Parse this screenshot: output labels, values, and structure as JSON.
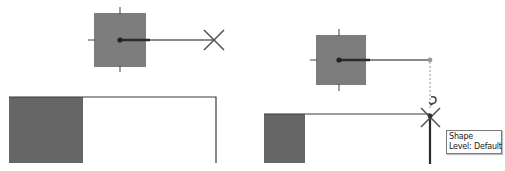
{
  "colors": {
    "background": "#ffffff",
    "shape_fill": "#7d7d7d",
    "shape_fill_dark": "#666666",
    "outline": "#3a3a3a",
    "handle_line": "#8a8a8a",
    "handle_line_thick": "#2a2a2a",
    "snap_marker": "#555555",
    "tooltip_border": "#7a7a7a"
  },
  "left_panel": {
    "shape": {
      "x": 94,
      "y": 13,
      "w": 52,
      "h": 54,
      "center": [
        120,
        40
      ]
    },
    "handle": {
      "from": [
        120,
        40
      ],
      "to": [
        214,
        40
      ],
      "thick_to": 150
    },
    "x_marker": {
      "cx": 214,
      "cy": 40,
      "size": 10
    },
    "wall": {
      "x1": 9,
      "x2": 216,
      "top": 97,
      "bottom": 163,
      "fill_to": 83
    }
  },
  "right_panel": {
    "shape": {
      "x": 316,
      "y": 35,
      "w": 50,
      "h": 50,
      "center": [
        339,
        60
      ]
    },
    "handle": {
      "from": [
        339,
        60
      ],
      "to": [
        430,
        60
      ],
      "thick_to": 370
    },
    "dashed_guide": {
      "x": 430,
      "y1": 62,
      "y2": 110
    },
    "x_marker": {
      "cx": 430,
      "cy": 117,
      "size": 10
    },
    "wall": {
      "x1": 264,
      "x2": 430,
      "top": 114,
      "bottom": 163,
      "fill_to": 305
    },
    "tooltip": {
      "line1": "Shape",
      "line2": "Level: Default"
    }
  },
  "icons": {
    "move_handle": "filled-dot-icon",
    "snap_point": "x-snap-icon",
    "rotate_cursor": "hook-arrow-icon"
  }
}
